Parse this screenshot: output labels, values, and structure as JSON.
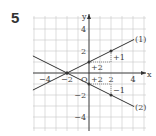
{
  "problem_number": "5",
  "axes": {
    "x_label": "x",
    "y_label": "y",
    "origin_label": "O",
    "x_ticks": [
      {
        "value": -4,
        "label": "−4"
      },
      {
        "value": -2,
        "label": "−2"
      },
      {
        "value": 2,
        "label": "2"
      },
      {
        "value": 4,
        "label": "4"
      }
    ],
    "y_ticks": [
      {
        "value": 4,
        "label": "4"
      },
      {
        "value": 2,
        "label": "2"
      },
      {
        "value": -2,
        "label": "−2"
      },
      {
        "value": -4,
        "label": "−4"
      }
    ],
    "range": {
      "xmin": -5,
      "xmax": 5,
      "ymin": -5,
      "ymax": 5
    }
  },
  "lines": [
    {
      "label": "(1)",
      "slope": 0.5,
      "intercept": 1,
      "points": [
        [
          -2,
          0
        ],
        [
          0,
          1
        ],
        [
          2,
          2
        ]
      ],
      "annotations": [
        {
          "text": "+2",
          "where": "run"
        },
        {
          "text": "+1",
          "where": "rise"
        }
      ]
    },
    {
      "label": "(2)",
      "slope": -0.5,
      "intercept": -1,
      "points": [
        [
          -2,
          0
        ],
        [
          0,
          -1
        ],
        [
          2,
          -2
        ]
      ],
      "annotations": [
        {
          "text": "+2",
          "where": "run"
        },
        {
          "text": "−1",
          "where": "rise"
        }
      ]
    }
  ],
  "colors": {
    "grid": "#c8c8c8",
    "axis": "#333333",
    "line": "#333333"
  }
}
